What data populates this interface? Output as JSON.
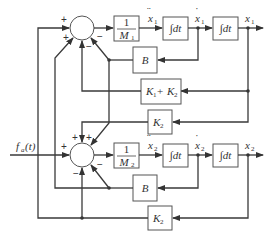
{
  "diagram": {
    "type": "block-diagram",
    "input": {
      "label": "f",
      "subscript": "a",
      "arg": "(t)"
    },
    "blocks": {
      "gain_m1": {
        "num": "1",
        "den": "M",
        "den_sub": "1"
      },
      "gain_m2": {
        "num": "1",
        "den": "M",
        "den_sub": "2"
      },
      "int_1a": {
        "label": "∫dt"
      },
      "int_1b": {
        "label": "∫dt"
      },
      "int_2a": {
        "label": "∫dt"
      },
      "int_2b": {
        "label": "∫dt"
      },
      "b_top": {
        "label": "B"
      },
      "b_bottom": {
        "label": "B"
      },
      "k1k2": {
        "k1": "K",
        "k1_sub": "1",
        "plus": " + ",
        "k2": "K",
        "k2_sub": "2"
      },
      "k2_top": {
        "label": "K",
        "sub": "2"
      },
      "k2_bottom": {
        "label": "K",
        "sub": "2"
      }
    },
    "signals": {
      "x1_ddot": {
        "label": "x",
        "sub": "1",
        "dots": "¨"
      },
      "x1_dot": {
        "label": "x",
        "sub": "1",
        "dots": "˙"
      },
      "x1": {
        "label": "x",
        "sub": "1"
      },
      "x2_ddot": {
        "label": "x",
        "sub": "2",
        "dots": "¨"
      },
      "x2_dot": {
        "label": "x",
        "sub": "2",
        "dots": "˙"
      },
      "x2": {
        "label": "x",
        "sub": "2"
      }
    },
    "junction1_signs": {
      "left": "+",
      "lower_left": "+",
      "bottom": "−",
      "lower_right": "−"
    },
    "junction2_signs": {
      "left": "+",
      "top": "+",
      "upper_right": "+",
      "bottom": "−",
      "lower_right": "−"
    }
  }
}
